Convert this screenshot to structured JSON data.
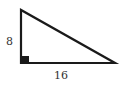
{
  "figure": {
    "type": "right-triangle",
    "labels": {
      "vertical_leg": "8",
      "horizontal_leg": "16"
    },
    "colors": {
      "stroke": "#1a1a1a",
      "right_angle_marker": "#1a1a1a",
      "label": "#333333",
      "background": "#ffffff"
    }
  }
}
